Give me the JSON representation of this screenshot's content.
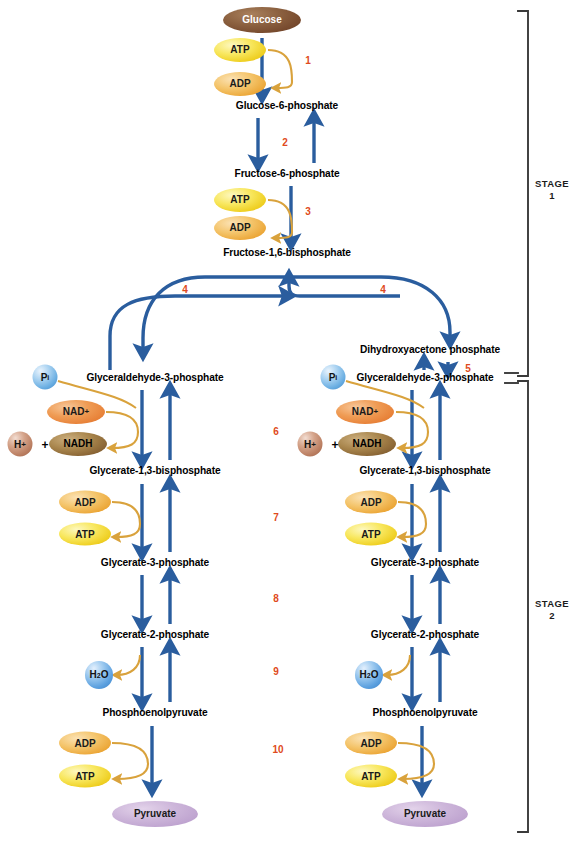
{
  "diagram": {
    "colors": {
      "arrow_blue": "#2a5d9e",
      "curve_gold": "#d39a2b",
      "number_orange": "#e04a20",
      "bracket_gray": "#3a3a3a"
    }
  },
  "metabolites": [
    {
      "id": "glucose",
      "label": "Glucose",
      "x": 262,
      "y": 20,
      "type": "ellipse-glucose"
    },
    {
      "id": "g6p",
      "label": "Glucose-6-phosphate",
      "x": 287,
      "y": 106,
      "type": "text"
    },
    {
      "id": "f6p",
      "label": "Fructose-6-phosphate",
      "x": 287,
      "y": 174,
      "type": "text"
    },
    {
      "id": "f16bp",
      "label": "Fructose-1,6-bisphosphate",
      "x": 287,
      "y": 253,
      "type": "text"
    },
    {
      "id": "dhap",
      "label": "Dihydroxyacetone phosphate",
      "x": 430,
      "y": 350,
      "type": "text"
    },
    {
      "id": "g3p-left",
      "label": "Glyceraldehyde-3-phosphate",
      "x": 155,
      "y": 378,
      "type": "text"
    },
    {
      "id": "g3p-right",
      "label": "Glyceraldehyde-3-phosphate",
      "x": 425,
      "y": 378,
      "type": "text"
    },
    {
      "id": "g13bp-left",
      "label": "Glycerate-1,3-bisphosphate",
      "x": 155,
      "y": 471,
      "type": "text"
    },
    {
      "id": "g13bp-right",
      "label": "Glycerate-1,3-bisphosphate",
      "x": 425,
      "y": 471,
      "type": "text"
    },
    {
      "id": "g3pho-left",
      "label": "Glycerate-3-phosphate",
      "x": 155,
      "y": 563,
      "type": "text"
    },
    {
      "id": "g3pho-right",
      "label": "Glycerate-3-phosphate",
      "x": 425,
      "y": 563,
      "type": "text"
    },
    {
      "id": "g2pho-left",
      "label": "Glycerate-2-phosphate",
      "x": 155,
      "y": 635,
      "type": "text"
    },
    {
      "id": "g2pho-right",
      "label": "Glycerate-2-phosphate",
      "x": 425,
      "y": 635,
      "type": "text"
    },
    {
      "id": "pep-left",
      "label": "Phosphoenolpyruvate",
      "x": 155,
      "y": 713,
      "type": "text"
    },
    {
      "id": "pep-right",
      "label": "Phosphoenolpyruvate",
      "x": 425,
      "y": 713,
      "type": "text"
    },
    {
      "id": "pyruvate-left",
      "label": "Pyruvate",
      "x": 155,
      "y": 814,
      "type": "ellipse-pyruvate"
    },
    {
      "id": "pyruvate-right",
      "label": "Pyruvate",
      "x": 425,
      "y": 814,
      "type": "ellipse-pyruvate"
    }
  ],
  "cofactors": [
    {
      "id": "atp-1",
      "label": "ATP",
      "kind": "atp",
      "x": 240,
      "y": 50,
      "w": 52,
      "h": 24
    },
    {
      "id": "adp-1",
      "label": "ADP",
      "kind": "adp",
      "x": 240,
      "y": 84,
      "w": 52,
      "h": 24
    },
    {
      "id": "atp-3",
      "label": "ATP",
      "kind": "atp",
      "x": 240,
      "y": 200,
      "w": 52,
      "h": 24
    },
    {
      "id": "adp-3",
      "label": "ADP",
      "kind": "adp",
      "x": 240,
      "y": 228,
      "w": 52,
      "h": 24
    },
    {
      "id": "nadplus-left",
      "label": "NAD",
      "sup": "+",
      "kind": "nadplus",
      "x": 76,
      "y": 412,
      "w": 58,
      "h": 24
    },
    {
      "id": "nadh-left",
      "label": "NADH",
      "kind": "nadh",
      "x": 78,
      "y": 444,
      "w": 58,
      "h": 24
    },
    {
      "id": "adp-7-left",
      "label": "ADP",
      "kind": "adp",
      "x": 85,
      "y": 502,
      "w": 52,
      "h": 23
    },
    {
      "id": "atp-7-left",
      "label": "ATP",
      "kind": "atp",
      "x": 85,
      "y": 534,
      "w": 52,
      "h": 23
    },
    {
      "id": "adp-10-left",
      "label": "ADP",
      "kind": "adp",
      "x": 85,
      "y": 743,
      "w": 52,
      "h": 23
    },
    {
      "id": "atp-10-left",
      "label": "ATP",
      "kind": "atp",
      "x": 85,
      "y": 776,
      "w": 52,
      "h": 23
    },
    {
      "id": "nadplus-right",
      "label": "NAD",
      "sup": "+",
      "kind": "nadplus",
      "x": 365,
      "y": 412,
      "w": 58,
      "h": 24
    },
    {
      "id": "nadh-right",
      "label": "NADH",
      "kind": "nadh",
      "x": 367,
      "y": 444,
      "w": 58,
      "h": 24
    },
    {
      "id": "adp-7-right",
      "label": "ADP",
      "kind": "adp",
      "x": 371,
      "y": 502,
      "w": 52,
      "h": 23
    },
    {
      "id": "atp-7-right",
      "label": "ATP",
      "kind": "atp",
      "x": 371,
      "y": 534,
      "w": 52,
      "h": 23
    },
    {
      "id": "adp-10-right",
      "label": "ADP",
      "kind": "adp",
      "x": 371,
      "y": 743,
      "w": 52,
      "h": 23
    },
    {
      "id": "atp-10-right",
      "label": "ATP",
      "kind": "atp",
      "x": 371,
      "y": 776,
      "w": 52,
      "h": 23
    }
  ],
  "spheres": [
    {
      "id": "pi-left",
      "label": "P",
      "sub": "i",
      "kind": "pi",
      "x": 45,
      "y": 377,
      "d": 25
    },
    {
      "id": "pi-right",
      "label": "P",
      "sub": "i",
      "kind": "pi",
      "x": 333,
      "y": 377,
      "d": 25
    },
    {
      "id": "hplus-left",
      "label": "H",
      "sup": "+",
      "kind": "hplus",
      "x": 20,
      "y": 444,
      "d": 25
    },
    {
      "id": "hplus-right",
      "label": "H",
      "sup": "+",
      "kind": "hplus",
      "x": 310,
      "y": 444,
      "d": 25
    },
    {
      "id": "h2o-left",
      "label": "H",
      "sub": "2",
      "suffix": "O",
      "kind": "h2o",
      "x": 99,
      "y": 675,
      "d": 28
    },
    {
      "id": "h2o-right",
      "label": "H",
      "sub": "2",
      "suffix": "O",
      "kind": "h2o",
      "x": 369,
      "y": 675,
      "d": 28
    }
  ],
  "plus_signs": [
    {
      "id": "plus-left",
      "label": "+",
      "x": 45,
      "y": 445
    },
    {
      "id": "plus-right",
      "label": "+",
      "x": 335,
      "y": 445
    }
  ],
  "step_numbers": [
    {
      "id": "step-1",
      "label": "1",
      "x": 308,
      "y": 61
    },
    {
      "id": "step-2",
      "label": "2",
      "x": 285,
      "y": 143
    },
    {
      "id": "step-3",
      "label": "3",
      "x": 308,
      "y": 212
    },
    {
      "id": "step-4a",
      "label": "4",
      "x": 185,
      "y": 290
    },
    {
      "id": "step-4b",
      "label": "4",
      "x": 383,
      "y": 290
    },
    {
      "id": "step-5",
      "label": "5",
      "x": 468,
      "y": 369
    },
    {
      "id": "step-6",
      "label": "6",
      "x": 276,
      "y": 432
    },
    {
      "id": "step-7",
      "label": "7",
      "x": 276,
      "y": 518
    },
    {
      "id": "step-8",
      "label": "8",
      "x": 276,
      "y": 599
    },
    {
      "id": "step-9",
      "label": "9",
      "x": 276,
      "y": 672
    },
    {
      "id": "step-10",
      "label": "10",
      "x": 278,
      "y": 750
    }
  ],
  "stages": [
    {
      "id": "stage-1",
      "line1": "STAGE",
      "line2": "1",
      "x": 552,
      "y": 190
    },
    {
      "id": "stage-2",
      "line1": "STAGE",
      "line2": "2",
      "x": 552,
      "y": 610
    }
  ]
}
